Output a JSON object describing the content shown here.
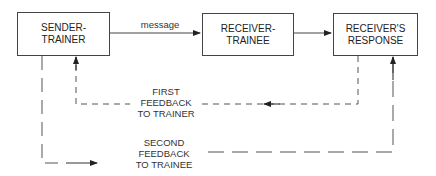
{
  "boxes": {
    "sender": {
      "line1": "SENDER-",
      "line2": "TRAINER"
    },
    "receiver": {
      "line1": "RECEIVER-",
      "line2": "TRAINEE"
    },
    "response": {
      "line1": "RECEIVER'S",
      "line2": "RESPONSE"
    }
  },
  "edges": {
    "message": "message",
    "first_feedback": {
      "line1": "FIRST",
      "line2": "FEEDBACK",
      "line3": "TO TRAINER"
    },
    "second_feedback": {
      "line1": "SECOND",
      "line2": "FEEDBACK",
      "line3": "TO TRAINEE"
    }
  }
}
